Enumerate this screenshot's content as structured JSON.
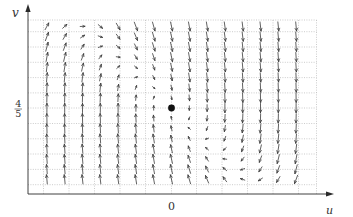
{
  "chart_data": {
    "type": "quiver",
    "title": "",
    "xlabel": "u",
    "ylabel": "v",
    "grid": true,
    "x_ticks": [
      {
        "value": 0,
        "label": "0"
      }
    ],
    "y_ticks": [
      {
        "value": 0.8,
        "label": "4/5",
        "numerator": "4",
        "denominator": "5"
      }
    ],
    "equilibrium": {
      "u": 0,
      "v": 0.8,
      "marker": "filled-dot"
    },
    "sample_u_index": [
      -7,
      -6,
      -5,
      -4,
      -3,
      -2,
      -1,
      0,
      1,
      2,
      3,
      4,
      5,
      6,
      7
    ],
    "rows": [
      {
        "v_index": 8,
        "du": 1.12,
        "dv": [
          2.04,
          1.04,
          0.04,
          -0.96,
          -1.96,
          -2.96,
          -3.96,
          -4.96,
          -5.96,
          -6.96,
          -7.96,
          -8.96,
          -9.96,
          -10.96,
          -11.96
        ]
      },
      {
        "v_index": 7,
        "du": 0.98,
        "dv": [
          2.66,
          1.66,
          0.66,
          -0.34,
          -1.34,
          -2.34,
          -3.34,
          -4.34,
          -5.34,
          -6.34,
          -7.34,
          -8.34,
          -9.34,
          -10.34,
          -11.34
        ]
      },
      {
        "v_index": 6,
        "du": 0.84,
        "dv": [
          3.28,
          2.28,
          1.28,
          0.28,
          -0.72,
          -1.72,
          -2.72,
          -3.72,
          -4.72,
          -5.72,
          -6.72,
          -7.72,
          -8.72,
          -9.72,
          -10.72
        ]
      },
      {
        "v_index": 5,
        "du": 0.7,
        "dv": [
          3.9,
          2.9,
          1.9,
          0.9,
          -0.1,
          -1.1,
          -2.1,
          -3.1,
          -4.1,
          -5.1,
          -6.1,
          -7.1,
          -8.1,
          -9.1,
          -10.1
        ]
      },
      {
        "v_index": 4,
        "du": 0.56,
        "dv": [
          4.52,
          3.52,
          2.52,
          1.52,
          0.52,
          -0.48,
          -1.48,
          -2.48,
          -3.48,
          -4.48,
          -5.48,
          -6.48,
          -7.48,
          -8.48,
          -9.48
        ]
      },
      {
        "v_index": 3,
        "du": 0.42,
        "dv": [
          5.14,
          4.14,
          3.14,
          2.14,
          1.14,
          0.14,
          -0.86,
          -1.86,
          -2.86,
          -3.86,
          -4.86,
          -5.86,
          -6.86,
          -7.86,
          -8.86
        ]
      },
      {
        "v_index": 2,
        "du": 0.28,
        "dv": [
          5.76,
          4.76,
          3.76,
          2.76,
          1.76,
          0.76,
          -0.24,
          -1.24,
          -2.24,
          -3.24,
          -4.24,
          -5.24,
          -6.24,
          -7.24,
          -8.24
        ]
      },
      {
        "v_index": 1,
        "du": 0.14,
        "dv": [
          6.38,
          5.38,
          4.38,
          3.38,
          2.38,
          1.38,
          0.38,
          -0.62,
          -1.62,
          -2.62,
          -3.62,
          -4.62,
          -5.62,
          -6.62,
          -7.62
        ]
      },
      {
        "v_index": 0,
        "du": 0.0,
        "dv": [
          7,
          6,
          5,
          4,
          3,
          2,
          1,
          0,
          -1,
          -2,
          -3,
          -4,
          -5,
          -6,
          -7
        ]
      },
      {
        "v_index": -1,
        "du": -0.14,
        "dv": [
          7.62,
          6.62,
          5.62,
          4.62,
          3.62,
          2.62,
          1.62,
          0.62,
          -0.38,
          -1.38,
          -2.38,
          -3.38,
          -4.38,
          -5.38,
          -6.38
        ]
      },
      {
        "v_index": -2,
        "du": -0.28,
        "dv": [
          8.24,
          7.24,
          6.24,
          5.24,
          4.24,
          3.24,
          2.24,
          1.24,
          0.24,
          -0.76,
          -1.76,
          -2.76,
          -3.76,
          -4.76,
          -5.76
        ]
      },
      {
        "v_index": -3,
        "du": -0.42,
        "dv": [
          8.86,
          7.86,
          6.86,
          5.86,
          4.86,
          3.86,
          2.86,
          1.86,
          0.86,
          -0.14,
          -1.14,
          -2.14,
          -3.14,
          -4.14,
          -5.14
        ]
      },
      {
        "v_index": -4,
        "du": -0.56,
        "dv": [
          9.48,
          8.48,
          7.48,
          6.48,
          5.48,
          4.48,
          3.48,
          2.48,
          1.48,
          0.48,
          -0.52,
          -1.52,
          -2.52,
          -3.52,
          -4.52
        ]
      },
      {
        "v_index": -5,
        "du": -0.7,
        "dv": [
          10.1,
          9.1,
          8.1,
          7.1,
          6.1,
          5.1,
          4.1,
          3.1,
          2.1,
          1.1,
          0.1,
          -0.9,
          -1.9,
          -2.9,
          -3.9
        ]
      },
      {
        "v_index": -6,
        "du": -0.84,
        "dv": [
          10.72,
          9.72,
          8.72,
          7.72,
          6.72,
          5.72,
          4.72,
          3.72,
          2.72,
          1.72,
          0.72,
          -0.28,
          -1.28,
          -2.28,
          -3.28
        ]
      },
      {
        "v_index": -7,
        "du": -0.98,
        "dv": [
          11.34,
          10.34,
          9.34,
          8.34,
          7.34,
          6.34,
          5.34,
          4.34,
          3.34,
          2.34,
          1.34,
          0.34,
          -0.66,
          -1.66,
          -2.66
        ]
      }
    ]
  }
}
